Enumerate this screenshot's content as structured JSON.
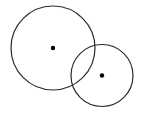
{
  "diagram": {
    "width": 141,
    "height": 113,
    "background": "#ffffff",
    "stroke_color": "#2a2a2a",
    "stroke_width": 1.2,
    "dot_color": "#000000",
    "dot_radius": 2.2,
    "circles": [
      {
        "name": "large-circle",
        "cx": 53,
        "cy": 48,
        "r": 42
      },
      {
        "name": "small-circle",
        "cx": 102,
        "cy": 75.5,
        "r": 31
      }
    ]
  }
}
